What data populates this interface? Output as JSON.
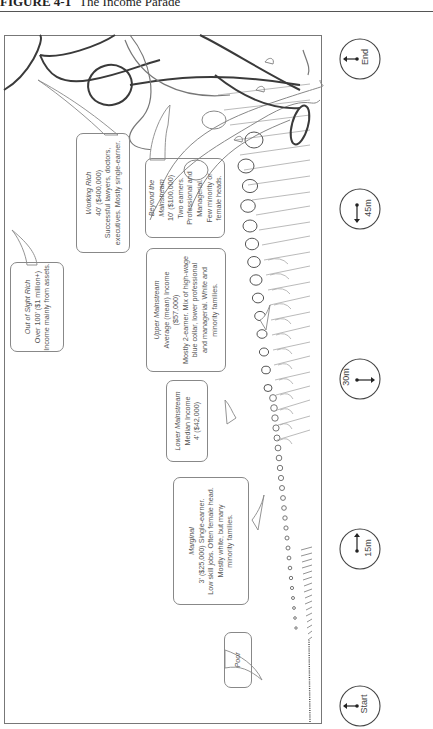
{
  "figure": {
    "number": "FIGURE 4-1",
    "title": "The Income Parade"
  },
  "callouts": [
    {
      "id": "out-of-sight-rich",
      "title": "Out of Sight Rich",
      "lines": [
        "Over 100' ($1 million+)",
        "Income mainly from assets."
      ]
    },
    {
      "id": "working-rich",
      "title": "Working Rich",
      "lines": [
        "40' ($400,000)",
        "Successful lawyers, doctors,",
        "executives. Mostly single-earner."
      ]
    },
    {
      "id": "beyond-mainstream",
      "title": "Beyond the Mainstream",
      "title_lines": [
        "Beyond the",
        "Mainstream"
      ],
      "lines": [
        "10' ($100,000)",
        "Two earners.",
        "Professional and",
        "Managerial.",
        "Few minority or",
        "female heads."
      ]
    },
    {
      "id": "upper-mainstream",
      "title": "Upper Mainstream",
      "lines": [
        "Average (mean) Income",
        "($57,000)",
        "Mostly 2-earner. Mix of high-wage",
        "blue collar, lower professional",
        "and managerial. White and",
        "minority families."
      ]
    },
    {
      "id": "lower-mainstream",
      "title": "Lower Mainstream",
      "lines": [
        "Median Income",
        "4' ($42,000)"
      ]
    },
    {
      "id": "marginal",
      "title": "Marginal",
      "lines": [
        "3' ($25,000) Single-earner.",
        "Low skill jobs. Often female head.",
        "Mostly white, but many",
        "minority families."
      ]
    },
    {
      "id": "poor",
      "title": "Poor",
      "lines": []
    }
  ],
  "timeline": [
    {
      "label": "End",
      "arrow": "left"
    },
    {
      "label": "45m",
      "arrow": "down"
    },
    {
      "label": "30m",
      "arrow": "right"
    },
    {
      "label": "15m",
      "arrow": "up"
    },
    {
      "label": "Start",
      "arrow": "left"
    }
  ],
  "colors": {
    "line_dark": "#3a3a3a",
    "line_mid": "#8a8a8a",
    "line_light": "#b5b5b5",
    "text": "#555555"
  }
}
